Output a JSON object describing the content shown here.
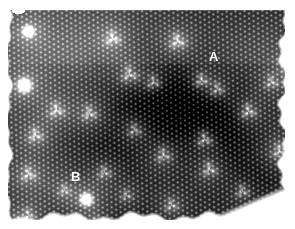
{
  "figure": {
    "kind": "stm-micrograph",
    "width": 295,
    "height": 229,
    "background_color": "#ffffff"
  },
  "scan": {
    "name": "stm-scan-image",
    "left": 8,
    "top": 9,
    "width": 277,
    "height": 211,
    "colormap": "grayscale",
    "background_gray": "#2f2f2f",
    "lattice": {
      "type": "hexagonal",
      "pitch_px": 4.45,
      "rotation_deg": -1.5,
      "spot_radius_px": 1.35,
      "spot_contrast": 0.42
    },
    "illumination": {
      "note": "broad dark diagonal band across centre-right",
      "vignette": 0.22
    },
    "scanline_artifact": {
      "y_px": 63,
      "brightness_step": 0.05
    }
  },
  "labels": [
    {
      "id": "label-a",
      "text": "A",
      "x": 209,
      "y": 50,
      "color": "#ffffff"
    },
    {
      "id": "label-b",
      "text": "B",
      "x": 71,
      "y": 170,
      "color": "#ffffff"
    }
  ],
  "chart_data": {
    "type": "heatmap",
    "title": "",
    "xlabel": "",
    "ylabel": "",
    "colormap": "gray",
    "zlim": [
      0.0,
      1.0
    ],
    "grid": false,
    "legend": false,
    "annotations": [
      {
        "label": "A",
        "x": 214,
        "y": 74,
        "kind": "trefoil-defect"
      },
      {
        "label": "B",
        "x": 78,
        "y": 190,
        "kind": "bright-adsorbate"
      }
    ],
    "defects": [
      {
        "x": 20,
        "y": 22,
        "r": 9,
        "amp": 1.0,
        "kind": "saturated-edge"
      },
      {
        "x": 104,
        "y": 29,
        "r": 9,
        "amp": 0.74,
        "kind": "trefoil"
      },
      {
        "x": 169,
        "y": 32,
        "r": 9,
        "amp": 0.8,
        "kind": "trefoil"
      },
      {
        "x": 281,
        "y": 58,
        "r": 8,
        "amp": 0.86,
        "kind": "trefoil"
      },
      {
        "x": 16,
        "y": 76,
        "r": 11,
        "amp": 1.0,
        "kind": "saturated-edge"
      },
      {
        "x": 121,
        "y": 65,
        "r": 10,
        "amp": 0.72,
        "kind": "trefoil"
      },
      {
        "x": 145,
        "y": 73,
        "r": 8,
        "amp": 0.66,
        "kind": "trefoil"
      },
      {
        "x": 193,
        "y": 71,
        "r": 8,
        "amp": 0.7,
        "kind": "trefoil"
      },
      {
        "x": 209,
        "y": 80,
        "r": 8,
        "amp": 0.62,
        "kind": "trefoil"
      },
      {
        "x": 263,
        "y": 73,
        "r": 8,
        "amp": 0.58,
        "kind": "trefoil"
      },
      {
        "x": 48,
        "y": 101,
        "r": 9,
        "amp": 0.72,
        "kind": "trefoil"
      },
      {
        "x": 81,
        "y": 104,
        "r": 9,
        "amp": 0.7,
        "kind": "trefoil"
      },
      {
        "x": 240,
        "y": 102,
        "r": 9,
        "amp": 0.74,
        "kind": "trefoil"
      },
      {
        "x": 27,
        "y": 126,
        "r": 9,
        "amp": 0.7,
        "kind": "trefoil"
      },
      {
        "x": 126,
        "y": 121,
        "r": 8,
        "amp": 0.6,
        "kind": "trefoil"
      },
      {
        "x": 196,
        "y": 130,
        "r": 9,
        "amp": 0.74,
        "kind": "trefoil"
      },
      {
        "x": 155,
        "y": 146,
        "r": 9,
        "amp": 0.64,
        "kind": "trefoil"
      },
      {
        "x": 271,
        "y": 142,
        "r": 9,
        "amp": 0.68,
        "kind": "trefoil"
      },
      {
        "x": 20,
        "y": 165,
        "r": 9,
        "amp": 0.66,
        "kind": "trefoil"
      },
      {
        "x": 96,
        "y": 163,
        "r": 8,
        "amp": 0.58,
        "kind": "trefoil"
      },
      {
        "x": 201,
        "y": 160,
        "r": 9,
        "amp": 0.7,
        "kind": "trefoil"
      },
      {
        "x": 78,
        "y": 190,
        "r": 10,
        "amp": 1.0,
        "kind": "bright-adsorbate"
      },
      {
        "x": 56,
        "y": 181,
        "r": 7,
        "amp": 0.52,
        "kind": "trefoil"
      },
      {
        "x": 118,
        "y": 186,
        "r": 7,
        "amp": 0.5,
        "kind": "trefoil"
      },
      {
        "x": 163,
        "y": 196,
        "r": 8,
        "amp": 0.6,
        "kind": "trefoil"
      },
      {
        "x": 234,
        "y": 182,
        "r": 8,
        "amp": 0.62,
        "kind": "trefoil"
      },
      {
        "x": 20,
        "y": 206,
        "r": 8,
        "amp": 0.58,
        "kind": "trefoil"
      },
      {
        "x": 9,
        "y": 214,
        "r": 9,
        "amp": 0.78,
        "kind": "saturated-edge"
      },
      {
        "x": 269,
        "y": 205,
        "r": 10,
        "amp": 0.9,
        "kind": "saturated-edge"
      },
      {
        "x": 87,
        "y": 215,
        "r": 8,
        "amp": 0.66,
        "kind": "trefoil"
      }
    ],
    "dark_patches": [
      {
        "x": 150,
        "y": 88,
        "rx": 58,
        "ry": 34,
        "amp": 0.22
      },
      {
        "x": 206,
        "y": 120,
        "rx": 52,
        "ry": 38,
        "amp": 0.2
      },
      {
        "x": 96,
        "y": 140,
        "rx": 46,
        "ry": 30,
        "amp": 0.12
      },
      {
        "x": 250,
        "y": 175,
        "rx": 40,
        "ry": 30,
        "amp": 0.14
      }
    ],
    "bright_patches": [
      {
        "x": 60,
        "y": 40,
        "rx": 55,
        "ry": 30,
        "amp": 0.1
      },
      {
        "x": 255,
        "y": 40,
        "rx": 45,
        "ry": 28,
        "amp": 0.08
      },
      {
        "x": 40,
        "y": 180,
        "rx": 50,
        "ry": 35,
        "amp": 0.09
      }
    ],
    "ragged_edges": {
      "bottom_right_notch": true,
      "left_edge_irregular": true,
      "top_left_notch": true
    }
  }
}
